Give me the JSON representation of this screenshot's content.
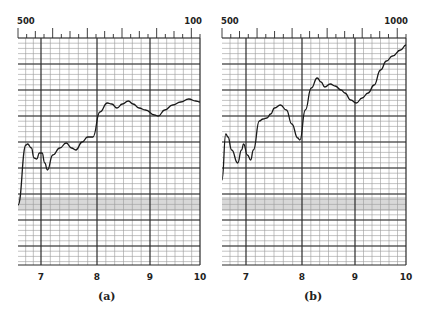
{
  "chart_data": [
    {
      "type": "line",
      "panel": "(a)",
      "caption": "(a)",
      "top_axis": {
        "left_label": "500",
        "right_label": "100"
      },
      "xlabel": "",
      "ylabel": "",
      "x_ticks": [
        "7",
        "8",
        "9",
        "10"
      ],
      "xlim": [
        6.6,
        10.0
      ],
      "grid": true,
      "shaded_band": true,
      "series": [
        {
          "name": "trace-a",
          "x": [
            6.6,
            6.75,
            6.78,
            6.85,
            6.9,
            6.95,
            7.0,
            7.05,
            7.1,
            7.15,
            7.25,
            7.38,
            7.5,
            7.6,
            7.68,
            7.8,
            7.9,
            8.0,
            8.13,
            8.27,
            8.35,
            8.45,
            8.55,
            8.66,
            8.75,
            8.86,
            8.98,
            9.15,
            9.22,
            9.34,
            9.49,
            9.64,
            9.79,
            9.92,
            10.0
          ],
          "y_px": [
            205,
            145,
            144,
            148,
            158,
            159,
            153,
            153,
            163,
            170,
            155,
            148,
            143,
            148,
            150,
            142,
            137,
            137,
            112,
            103,
            104,
            108,
            104,
            101,
            104,
            108,
            110,
            115,
            116,
            110,
            105,
            102,
            99,
            101,
            102
          ]
        }
      ]
    },
    {
      "type": "line",
      "panel": "(b)",
      "caption": "(b)",
      "top_axis": {
        "left_label": "500",
        "right_label": "1000"
      },
      "xlabel": "",
      "ylabel": "",
      "x_ticks": [
        "7",
        "8",
        "9",
        "10"
      ],
      "xlim": [
        6.6,
        10.0
      ],
      "grid": true,
      "shaded_band": true,
      "series": [
        {
          "name": "trace-b",
          "x": [
            6.6,
            6.67,
            6.71,
            6.78,
            6.89,
            6.96,
            7.0,
            7.07,
            7.13,
            7.18,
            7.29,
            7.36,
            7.43,
            7.5,
            7.57,
            7.68,
            7.79,
            7.89,
            8.0,
            8.04,
            8.14,
            8.25,
            8.36,
            8.43,
            8.5,
            8.6,
            8.69,
            8.8,
            8.87,
            8.98,
            9.08,
            9.19,
            9.3,
            9.41,
            9.53,
            9.64,
            9.75,
            9.9,
            10.0
          ],
          "y_px": [
            180,
            134,
            137,
            150,
            163,
            150,
            144,
            155,
            160,
            150,
            121,
            119,
            118,
            114,
            108,
            105,
            110,
            124,
            138,
            140,
            110,
            88,
            78,
            82,
            87,
            84,
            86,
            90,
            93,
            100,
            103,
            98,
            93,
            85,
            70,
            61,
            56,
            50,
            45
          ]
        }
      ]
    }
  ],
  "panels": [
    {
      "id": "a",
      "caption": "(a)",
      "top_left_label": "500",
      "top_right_label": "100",
      "x_tick_labels": [
        "7",
        "8",
        "9",
        "10"
      ]
    },
    {
      "id": "b",
      "caption": "(b)",
      "top_left_label": "500",
      "top_right_label": "1000",
      "x_tick_labels": [
        "7",
        "8",
        "9",
        "10"
      ]
    }
  ],
  "colors": {
    "grid_minor": "#9a9a9a",
    "grid_major": "#2a2a2a",
    "curve": "#1a1a1a",
    "band": "#d8d8d8",
    "background": "#ffffff"
  }
}
